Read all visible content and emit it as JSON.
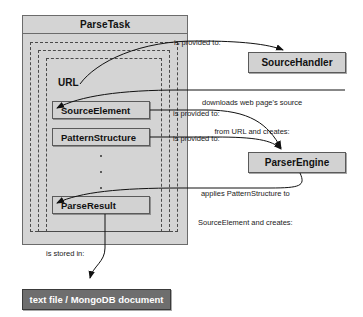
{
  "diagram": {
    "colors": {
      "container_fill": "#d4d4d4",
      "box_fill": "#d2d2d2",
      "dark_box_fill": "#6e6e6e",
      "stroke": "#5a5a5a",
      "dashed_stroke": "#4a4a4a",
      "text": "#111111",
      "dark_box_text": "#ffffff"
    }
  },
  "container": {
    "title": "ParseTask"
  },
  "inner_nodes": [
    {
      "id": "url",
      "label": "URL",
      "type": "plain-label"
    },
    {
      "id": "source_element",
      "label": "SourceElement",
      "type": "box"
    },
    {
      "id": "pattern_structure",
      "label": "PatternStructure",
      "type": "box"
    },
    {
      "id": "ellipsis",
      "label": "",
      "type": "vertical-dots"
    },
    {
      "id": "parse_result",
      "label": "ParseResult",
      "type": "box"
    }
  ],
  "external_nodes": [
    {
      "id": "source_handler",
      "label": "SourceHandler"
    },
    {
      "id": "parser_engine",
      "label": "ParserEngine"
    }
  ],
  "storage_node": {
    "id": "storage",
    "label": "text file / MongoDB document"
  },
  "edges": [
    {
      "id": "url-to-sourcehandler",
      "from": "url",
      "to": "source_handler",
      "label": "is provided to:"
    },
    {
      "id": "sourcehandler-to-sourceelement",
      "from": "source_handler",
      "to": "source_element",
      "label_line1": "downloads web page's source",
      "label_line2": "from URL and creates:"
    },
    {
      "id": "sourceelement-to-parserengine",
      "from": "source_element",
      "to": "parser_engine",
      "label": "is provided to:"
    },
    {
      "id": "patternstructure-to-parserengine",
      "from": "pattern_structure",
      "to": "parser_engine",
      "label": "is provided to:"
    },
    {
      "id": "parserengine-to-parseresult",
      "from": "parser_engine",
      "to": "parse_result",
      "label_line1": "applies PatternStructure to",
      "label_line2": "SourceElement and creates:"
    },
    {
      "id": "parseresult-to-storage",
      "from": "parse_result",
      "to": "storage",
      "label": "is stored in:"
    }
  ]
}
